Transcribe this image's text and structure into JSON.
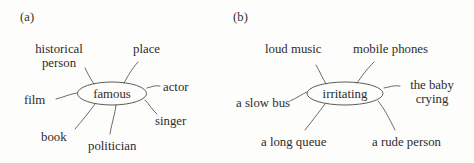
{
  "figure": {
    "background_color": "#fdfdfc",
    "ink_color": "#2e2c2a",
    "stroke_color": "#4a4845"
  },
  "panels": [
    {
      "tag": "(a)",
      "center": "famous",
      "branches": [
        {
          "label": "historical person",
          "line1": "historical",
          "line2": "person"
        },
        {
          "label": "place",
          "line1": "place",
          "line2": ""
        },
        {
          "label": "actor",
          "line1": "actor",
          "line2": ""
        },
        {
          "label": "singer",
          "line1": "singer",
          "line2": ""
        },
        {
          "label": "politician",
          "line1": "politician",
          "line2": ""
        },
        {
          "label": "book",
          "line1": "book",
          "line2": ""
        },
        {
          "label": "film",
          "line1": "film",
          "line2": ""
        }
      ]
    },
    {
      "tag": "(b)",
      "center": "irritating",
      "branches": [
        {
          "label": "loud music",
          "line1": "loud music",
          "line2": ""
        },
        {
          "label": "mobile phones",
          "line1": "mobile phones",
          "line2": ""
        },
        {
          "label": "the baby crying",
          "line1": "the baby",
          "line2": "crying"
        },
        {
          "label": "a rude person",
          "line1": "a rude person",
          "line2": ""
        },
        {
          "label": "a long queue",
          "line1": "a long queue",
          "line2": ""
        },
        {
          "label": "a slow bus",
          "line1": "a slow bus",
          "line2": ""
        }
      ]
    }
  ]
}
